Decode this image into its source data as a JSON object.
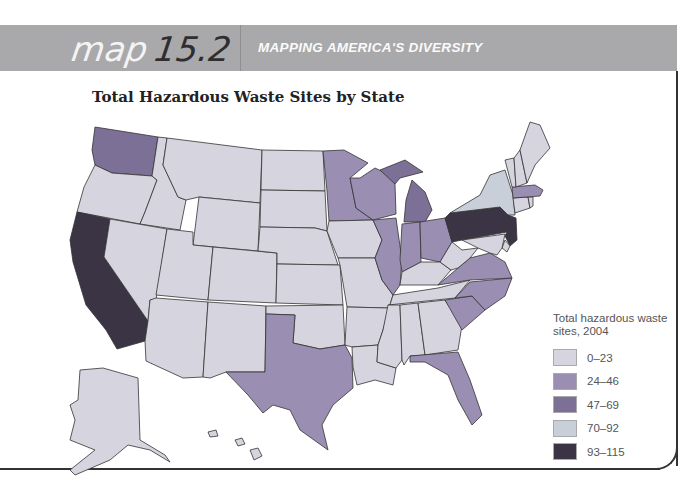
{
  "header": {
    "map_label": "map",
    "map_number": "15.2",
    "subtitle": "MAPPING AMERICA'S DIVERSITY"
  },
  "title": "Total Hazardous Waste Sites by State",
  "legend": {
    "title_line1": "Total hazardous waste",
    "title_line2": "sites, 2004",
    "items": [
      {
        "label": "0–23",
        "color": "#d6d4de"
      },
      {
        "label": "24–46",
        "color": "#9a8fb2"
      },
      {
        "label": "47–69",
        "color": "#7d7096"
      },
      {
        "label": "70–92",
        "color": "#c8cfd8"
      },
      {
        "label": "93–115",
        "color": "#3a3444"
      }
    ]
  },
  "map_data": {
    "categories": [
      "0–23",
      "24–46",
      "47–69",
      "70–92",
      "93–115"
    ],
    "states": {
      "WA": "47–69",
      "OR": "0–23",
      "CA": "93–115",
      "ID": "0–23",
      "NV": "0–23",
      "MT": "0–23",
      "WY": "0–23",
      "UT": "0–23",
      "AZ": "0–23",
      "CO": "0–23",
      "NM": "0–23",
      "ND": "0–23",
      "SD": "0–23",
      "NE": "0–23",
      "KS": "0–23",
      "OK": "0–23",
      "TX": "24–46",
      "MN": "24–46",
      "IA": "0–23",
      "MO": "0–23",
      "AR": "0–23",
      "LA": "0–23",
      "WI": "24–46",
      "IL": "24–46",
      "MI": "47–69",
      "IN": "24–46",
      "OH": "24–46",
      "KY": "0–23",
      "TN": "0–23",
      "MS": "0–23",
      "AL": "0–23",
      "GA": "0–23",
      "FL": "24–46",
      "SC": "24–46",
      "NC": "24–46",
      "VA": "24–46",
      "WV": "0–23",
      "PA": "93–115",
      "NY": "70–92",
      "NJ": "93–115",
      "DE": "0–23",
      "MD": "0–23",
      "CT": "0–23",
      "RI": "0–23",
      "MA": "24–46",
      "VT": "0–23",
      "NH": "0–23",
      "ME": "0–23",
      "AK": "0–23",
      "HI": "0–23"
    }
  }
}
